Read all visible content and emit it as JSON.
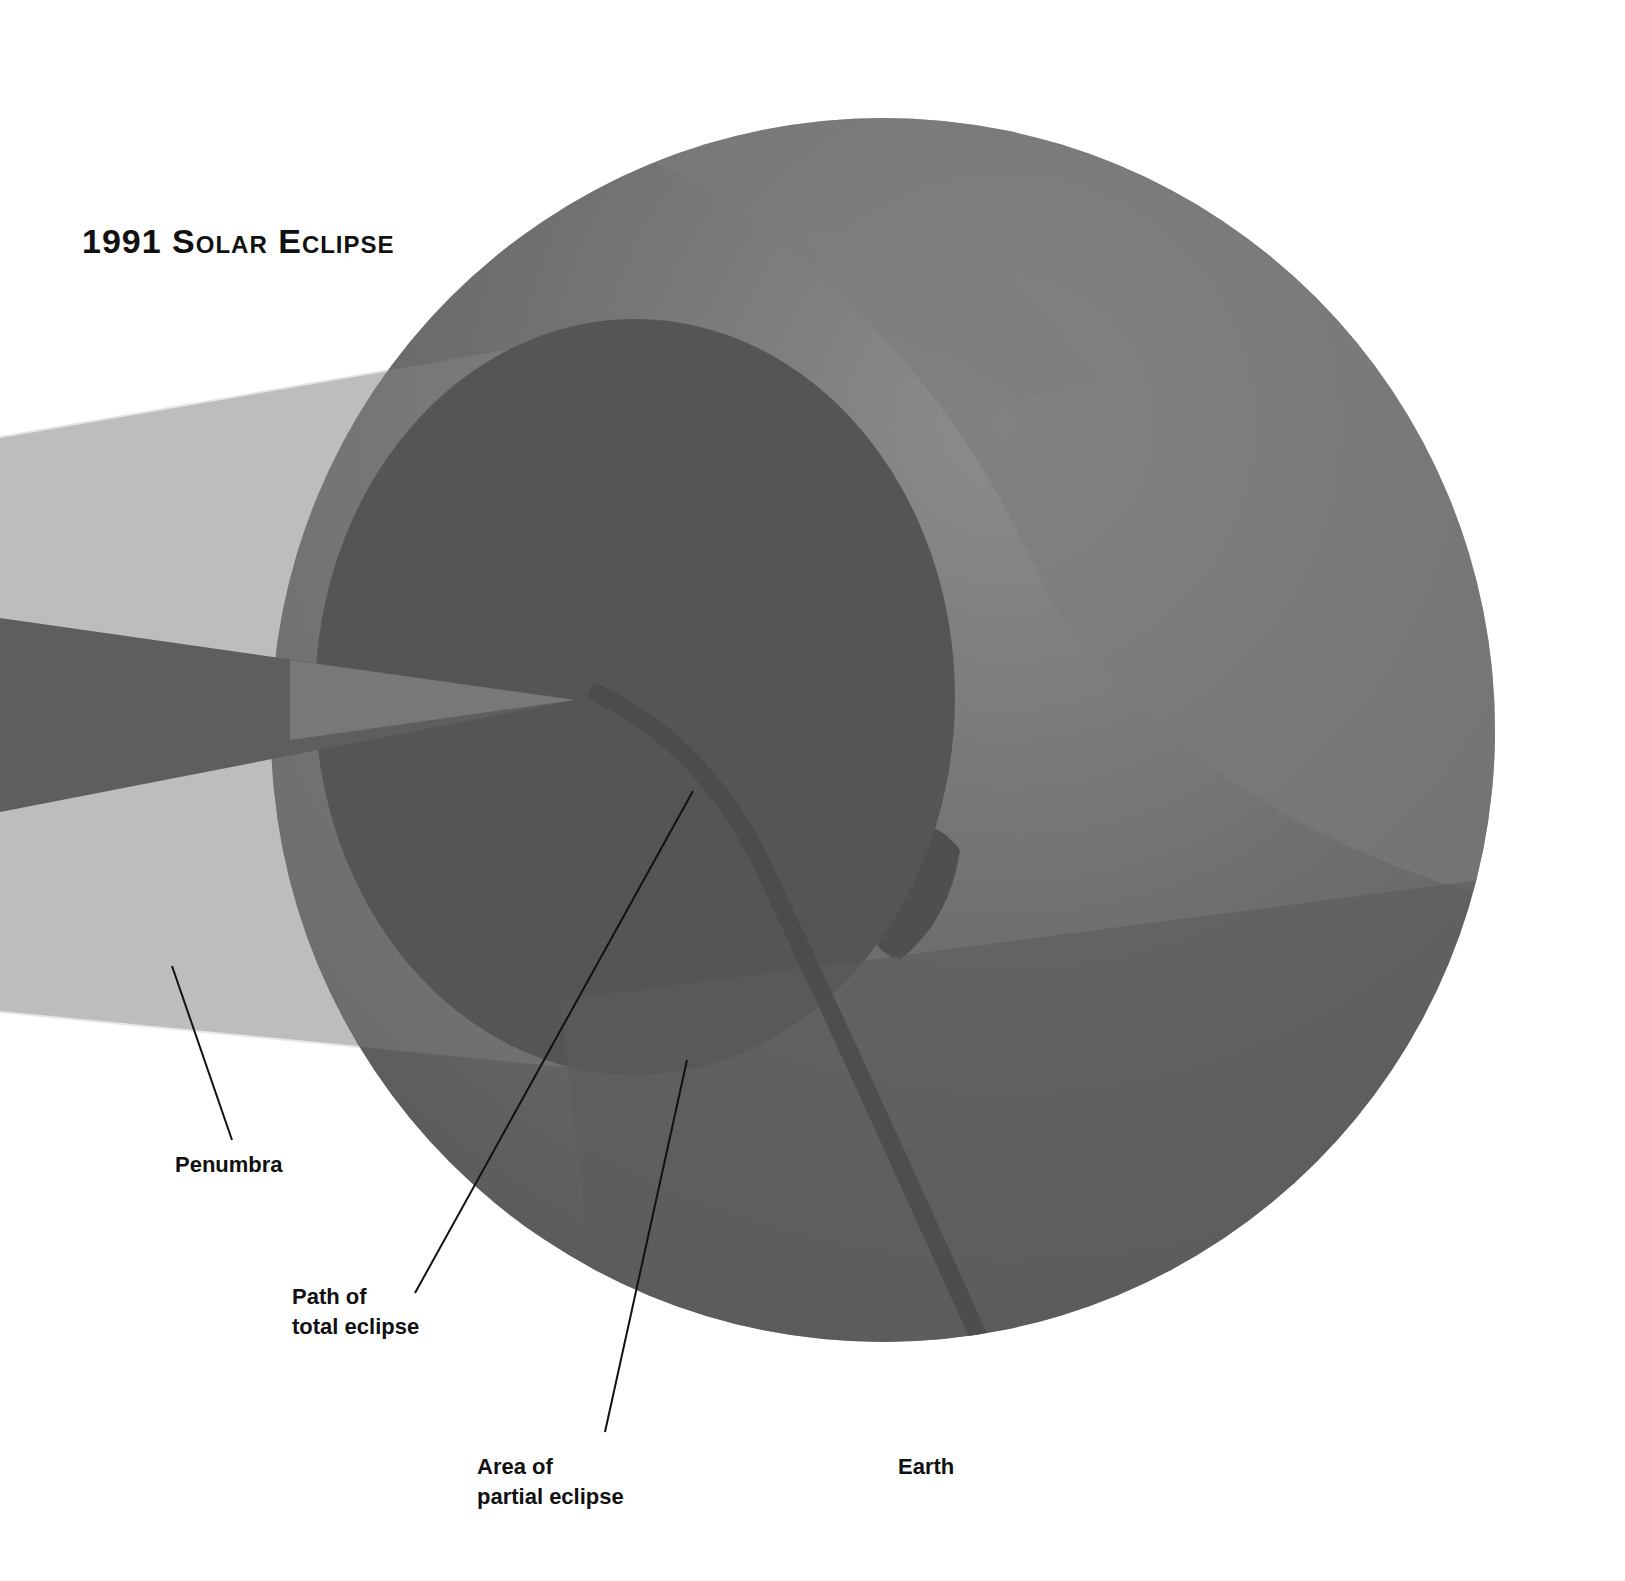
{
  "title": "1991 Solar Eclipse",
  "labels": {
    "penumbra": "Penumbra",
    "path_total_line1": "Path of",
    "path_total_line2": "total eclipse",
    "partial_line1": "Area of",
    "partial_line2": "partial eclipse",
    "earth": "Earth"
  },
  "colors": {
    "background": "#ffffff",
    "earth": "#6f6f6f",
    "earth_light": "#858585",
    "partial_area": "#565656",
    "penumbra_beam": "#bdbdbd",
    "umbra_cone": "#5e5e5e",
    "umbra_tip": "#8a8a8a",
    "text": "#111111",
    "leader_line": "#111111"
  }
}
